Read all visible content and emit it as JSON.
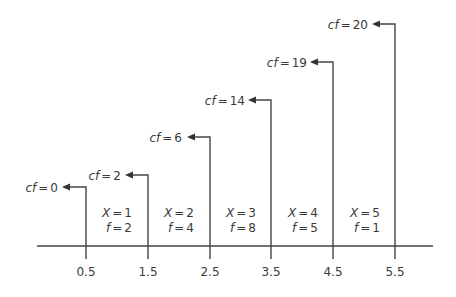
{
  "diagram": {
    "colors": {
      "line": "#444444",
      "text": "#3a3a3a",
      "background": "#ffffff"
    },
    "boundaries": [
      {
        "value": "0.5",
        "cf_label": "cf",
        "eq": "=",
        "cf": "0"
      },
      {
        "value": "1.5",
        "cf_label": "cf",
        "eq": "=",
        "cf": "2"
      },
      {
        "value": "2.5",
        "cf_label": "cf",
        "eq": "=",
        "cf": "6"
      },
      {
        "value": "3.5",
        "cf_label": "cf",
        "eq": "=",
        "cf": "14"
      },
      {
        "value": "4.5",
        "cf_label": "cf",
        "eq": "=",
        "cf": "19"
      },
      {
        "value": "5.5",
        "cf_label": "cf",
        "eq": "=",
        "cf": "20"
      }
    ],
    "classes": [
      {
        "x_label": "X",
        "x": "1",
        "f_label": "f",
        "f": "2"
      },
      {
        "x_label": "X",
        "x": "2",
        "f_label": "f",
        "f": "4"
      },
      {
        "x_label": "X",
        "x": "3",
        "f_label": "f",
        "f": "8"
      },
      {
        "x_label": "X",
        "x": "4",
        "f_label": "f",
        "f": "5"
      },
      {
        "x_label": "X",
        "x": "5",
        "f_label": "f",
        "f": "1"
      }
    ]
  }
}
